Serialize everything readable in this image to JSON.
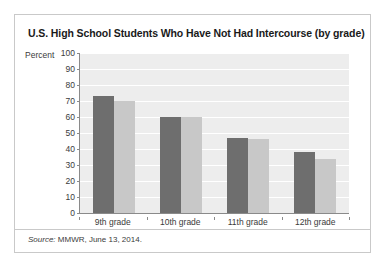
{
  "figure": {
    "title": "U.S. High School Students Who Have Not Had Intercourse (by grade)",
    "source_word": "Source:",
    "source_text": "MMWR, June 13, 2014."
  },
  "legend": {
    "items": [
      {
        "label": "Female",
        "color": "#6e6e6e"
      },
      {
        "label": "Male",
        "color": "#c8c8c8"
      }
    ]
  },
  "axis": {
    "ylabel": "Percent",
    "yticks": [
      "100",
      "90",
      "80",
      "70",
      "60",
      "50",
      "40",
      "30",
      "20",
      "10",
      "0"
    ]
  },
  "chart_data": {
    "type": "bar",
    "title": "U.S. High School Students Who Have Not Had Intercourse (by grade)",
    "xlabel": "",
    "ylabel": "Percent",
    "ylim": [
      0,
      100
    ],
    "ytick_step": 10,
    "grid": true,
    "legend_position": "top-right",
    "categories": [
      "9th grade",
      "10th grade",
      "11th grade",
      "12th grade"
    ],
    "series": [
      {
        "name": "Female",
        "color": "#6e6e6e",
        "values": [
          73,
          60,
          47,
          38
        ]
      },
      {
        "name": "Male",
        "color": "#c8c8c8",
        "values": [
          70,
          60,
          46,
          34
        ]
      }
    ],
    "source": "Source: MMWR, June 13, 2014."
  }
}
